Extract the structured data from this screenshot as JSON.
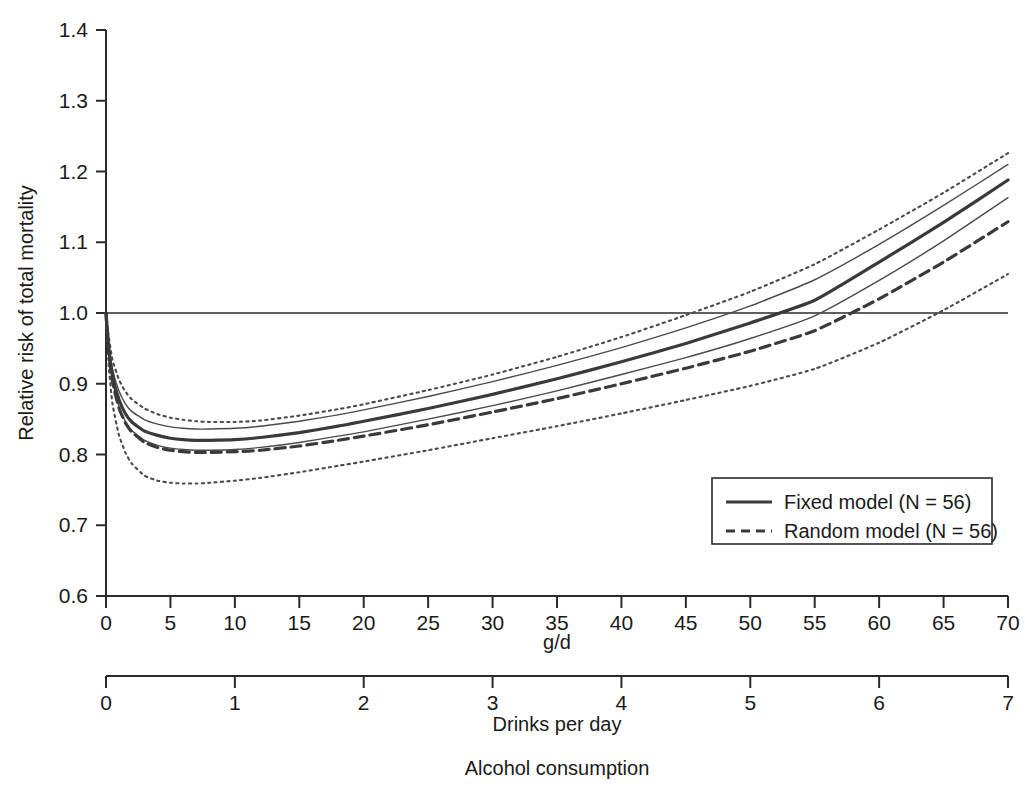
{
  "chart_data": {
    "type": "line",
    "title": "",
    "xlabel": "g/d",
    "xlabel2": "Drinks per day",
    "caption": "Alcohol consumption",
    "ylabel": "Relative risk of total mortality",
    "xlim": [
      0,
      70
    ],
    "ylim": [
      0.6,
      1.4
    ],
    "xticks": [
      0,
      5,
      10,
      15,
      20,
      25,
      30,
      35,
      40,
      45,
      50,
      55,
      60,
      65,
      70
    ],
    "xticklabels": [
      "0",
      "5",
      "10",
      "15",
      "20",
      "25",
      "30",
      "35",
      "40",
      "45",
      "50",
      "55",
      "60",
      "65",
      "70"
    ],
    "xticks2": [
      0,
      1,
      2,
      3,
      4,
      5,
      6,
      7
    ],
    "xticklabels2": [
      "0",
      "1",
      "2",
      "3",
      "4",
      "5",
      "6",
      "7"
    ],
    "yticks": [
      0.6,
      0.7,
      0.8,
      0.9,
      1.0,
      1.1,
      1.2,
      1.3,
      1.4
    ],
    "yticklabels": [
      "0.6",
      "0.7",
      "0.8",
      "0.9",
      "1.0",
      "1.1",
      "1.2",
      "1.3",
      "1.4"
    ],
    "grid": false,
    "reference_line": {
      "y": 1.0,
      "style": "solid",
      "note": "null-effect line at RR = 1.0"
    },
    "legend": {
      "position": "lower-right-inside",
      "entries": [
        {
          "label": "Fixed model (N = 56)",
          "style": "solid",
          "width": 3.2,
          "color": "#3a3a3a"
        },
        {
          "label": "Random model (N = 56)",
          "style": "dashed",
          "width": 3.2,
          "color": "#3a3a3a"
        }
      ]
    },
    "x": [
      0,
      0.2,
      0.5,
      1,
      1.5,
      2,
      3,
      4,
      5,
      6,
      7,
      8,
      10,
      12,
      15,
      18,
      20,
      25,
      30,
      35,
      40,
      45,
      50,
      55,
      60,
      65,
      70
    ],
    "series": [
      {
        "name": "Fixed model (N = 56)",
        "style": "solid",
        "width": 3.2,
        "color": "#3a3a3a",
        "values": [
          1.0,
          0.953,
          0.912,
          0.878,
          0.858,
          0.846,
          0.833,
          0.827,
          0.823,
          0.821,
          0.82,
          0.82,
          0.821,
          0.824,
          0.831,
          0.84,
          0.847,
          0.865,
          0.885,
          0.907,
          0.931,
          0.957,
          0.986,
          1.018,
          1.072,
          1.128,
          1.188
        ]
      },
      {
        "name": "Fixed model upper 95% CI",
        "style": "thin-solid",
        "width": 1.4,
        "color": "#4a4a4a",
        "values": [
          1.0,
          0.959,
          0.921,
          0.89,
          0.872,
          0.861,
          0.849,
          0.843,
          0.839,
          0.837,
          0.836,
          0.836,
          0.837,
          0.84,
          0.847,
          0.856,
          0.863,
          0.882,
          0.903,
          0.926,
          0.951,
          0.979,
          1.01,
          1.047,
          1.097,
          1.152,
          1.21
        ]
      },
      {
        "name": "Fixed model lower 95% CI",
        "style": "thin-solid",
        "width": 1.4,
        "color": "#4a4a4a",
        "values": [
          1.0,
          0.948,
          0.904,
          0.868,
          0.847,
          0.834,
          0.82,
          0.813,
          0.809,
          0.807,
          0.806,
          0.806,
          0.807,
          0.81,
          0.817,
          0.826,
          0.832,
          0.85,
          0.869,
          0.89,
          0.913,
          0.937,
          0.964,
          0.996,
          1.046,
          1.102,
          1.163
        ]
      },
      {
        "name": "Random model (N = 56)",
        "style": "dashed",
        "width": 3.2,
        "color": "#3a3a3a",
        "values": [
          1.0,
          0.948,
          0.903,
          0.866,
          0.845,
          0.832,
          0.817,
          0.81,
          0.806,
          0.804,
          0.803,
          0.803,
          0.804,
          0.806,
          0.812,
          0.82,
          0.826,
          0.842,
          0.86,
          0.879,
          0.9,
          0.922,
          0.946,
          0.975,
          1.02,
          1.072,
          1.129
        ]
      },
      {
        "name": "Random model upper 95% CI",
        "style": "dotted",
        "width": 2.1,
        "color": "#4a4a4a",
        "values": [
          1.0,
          0.968,
          0.934,
          0.906,
          0.889,
          0.878,
          0.865,
          0.857,
          0.852,
          0.849,
          0.847,
          0.846,
          0.846,
          0.848,
          0.855,
          0.864,
          0.871,
          0.891,
          0.913,
          0.938,
          0.966,
          0.997,
          1.03,
          1.069,
          1.118,
          1.17,
          1.226
        ]
      },
      {
        "name": "Random model lower 95% CI",
        "style": "dotted",
        "width": 2.1,
        "color": "#4a4a4a",
        "values": [
          1.0,
          0.928,
          0.872,
          0.828,
          0.803,
          0.787,
          0.77,
          0.763,
          0.76,
          0.759,
          0.759,
          0.76,
          0.763,
          0.767,
          0.775,
          0.784,
          0.79,
          0.806,
          0.823,
          0.84,
          0.858,
          0.877,
          0.897,
          0.921,
          0.958,
          1.004,
          1.055
        ]
      }
    ]
  },
  "colors": {
    "axis": "#2a2a2a",
    "curve_main": "#3a3a3a",
    "curve_ci": "#4a4a4a",
    "background": "#ffffff",
    "text": "#1a1a1a"
  }
}
